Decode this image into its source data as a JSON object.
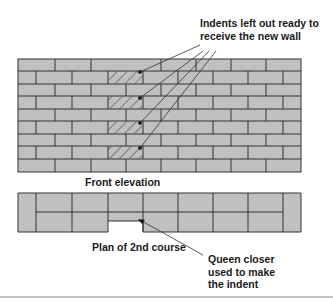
{
  "labels": {
    "indents": "Indents left out ready to receive the new wall",
    "indents_line1": "Indents left out ready to",
    "indents_line2": "receive the new wall",
    "front_elevation": "Front elevation",
    "plan": "Plan of 2nd course",
    "queen_closer_line1": "Queen closer",
    "queen_closer_line2": "used to make",
    "queen_closer_line3": "the indent"
  },
  "colors": {
    "brick": "#c0c0c0",
    "mortar": "#333333",
    "text": "#1a1a1a",
    "background": "#ffffff",
    "rule": "#888888"
  },
  "wall": {
    "courses": 9,
    "indent_courses": [
      2,
      4,
      6,
      8
    ]
  }
}
